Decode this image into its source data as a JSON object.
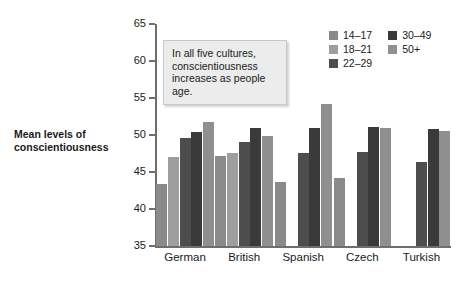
{
  "chart_data": {
    "type": "bar",
    "title": "",
    "xlabel": "",
    "ylabel": "Mean levels of conscientiousness",
    "ylim": [
      35,
      65
    ],
    "ytick_step": 5,
    "yticks": [
      35,
      40,
      45,
      50,
      55,
      60,
      65
    ],
    "grid": false,
    "legend_position": "top-right",
    "categories": [
      "German",
      "British",
      "Spanish",
      "Czech",
      "Turkish"
    ],
    "series": [
      {
        "name": "14–17",
        "color": "#8a8a8a",
        "values": [
          43.4,
          47.2,
          43.6,
          44.2,
          null
        ]
      },
      {
        "name": "18–21",
        "color": "#9e9e9e",
        "values": [
          47.0,
          47.6,
          null,
          null,
          null
        ]
      },
      {
        "name": "22–29",
        "color": "#4d4d4d",
        "values": [
          49.6,
          49.0,
          47.6,
          47.7,
          46.3
        ]
      },
      {
        "name": "30–49",
        "color": "#3a3a3a",
        "values": [
          50.4,
          51.0,
          51.0,
          51.1,
          50.8
        ]
      },
      {
        "name": "50+",
        "color": "#8f8f8f",
        "values": [
          51.8,
          49.9,
          54.2,
          51.0,
          50.5
        ]
      }
    ],
    "annotations": [
      {
        "id": "insight-box",
        "text": "In all five cultures, conscientiousness increases as people age."
      }
    ]
  },
  "axis": {
    "y_title": "Mean levels of conscientiousness",
    "tick_labels": [
      "65",
      "60",
      "55",
      "50",
      "45",
      "40",
      "35"
    ]
  },
  "annotation": {
    "line1": "In all five cultures,",
    "line2": "conscientiousness",
    "line3": "increases as people age."
  },
  "legend": {
    "items": [
      {
        "label": "14–17"
      },
      {
        "label": "18–21"
      },
      {
        "label": "22–29"
      },
      {
        "label": "30–49"
      },
      {
        "label": "50+"
      }
    ]
  }
}
